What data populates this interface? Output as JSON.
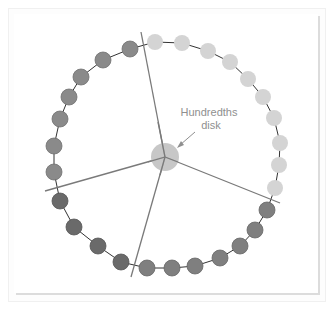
{
  "diagram": {
    "label_line1": "Hundredths",
    "label_line2": "disk",
    "colors": {
      "light_bead": "#d4d4d4",
      "medium_bead": "#8a8a8a",
      "dark_bead": "#6e6e6e",
      "bottom_bead": "#868686",
      "center_disk": "#bdbdbd",
      "lines": "#7a7a7a",
      "label": "#8f8f8f"
    },
    "center": {
      "x": 165,
      "y": 157,
      "r": 14
    },
    "bead_groups": [
      {
        "name": "light",
        "count": 10
      },
      {
        "name": "bottom-right",
        "count": 7
      },
      {
        "name": "bottom-left",
        "count": 4
      },
      {
        "name": "left",
        "count": 7
      }
    ],
    "total_beads": 28
  }
}
